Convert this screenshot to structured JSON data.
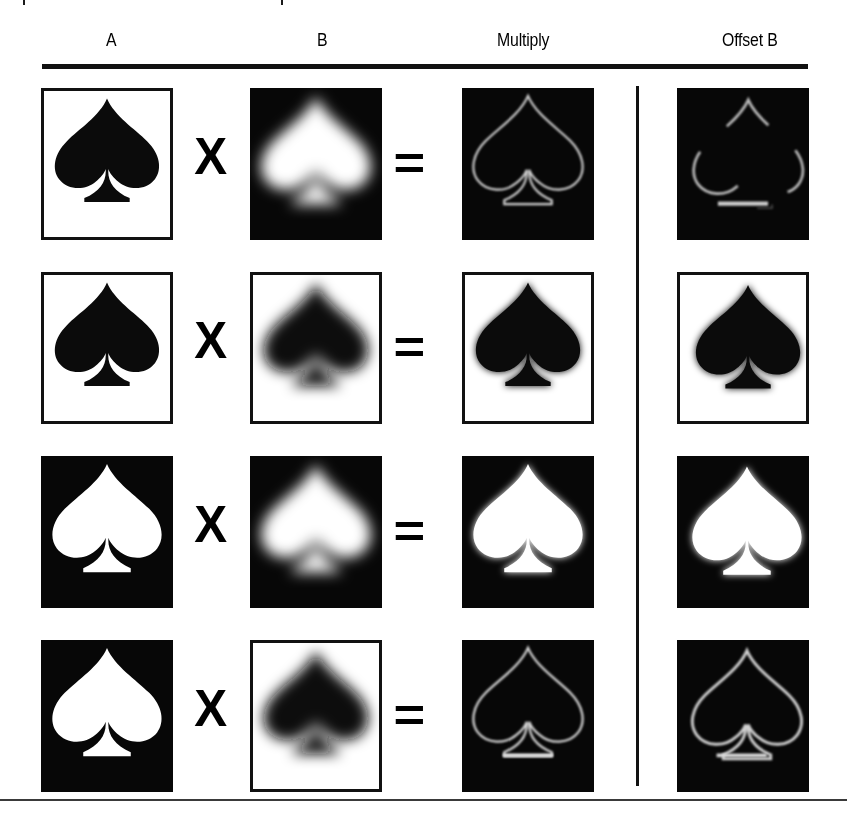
{
  "figure": {
    "background": "#ffffff",
    "width": 847,
    "height": 813,
    "accent_dark": "#070707",
    "accent_light": "#ffffff",
    "rule_color": "#111111"
  },
  "headers": [
    {
      "label": "A",
      "center_x": 106
    },
    {
      "label": "B",
      "center_x": 317
    },
    {
      "label": "Multiply",
      "center_x": 524
    },
    {
      "label": "Offset B",
      "center_x": 753
    }
  ],
  "operators": {
    "times": "X",
    "equals": "="
  },
  "columns": {
    "a_x": 41,
    "b_x": 250,
    "multiply_x": 462,
    "offset_x": 677,
    "times_x": 196,
    "equals_x": 396,
    "divider_x": 636
  },
  "rows": [
    {
      "name": "row-1",
      "top": 88,
      "panels": {
        "a": {
          "bg": "black-on-white",
          "border": true,
          "shape": "sharp",
          "fill": "#0b0b0b",
          "blur": 0
        },
        "b": {
          "bg": "white-on-black",
          "border": false,
          "shape": "blurred",
          "fill": "#ffffff",
          "blur": 9
        },
        "multiply": {
          "bg": "outline-on-black",
          "border": false,
          "shape": "outline",
          "fill": "#c9c9c9",
          "blur": 2
        },
        "offset": {
          "bg": "outline-on-black",
          "border": false,
          "shape": "offset-outline",
          "fill": "#c9c9c9",
          "blur": 2
        }
      }
    },
    {
      "name": "row-2",
      "top": 272,
      "panels": {
        "a": {
          "bg": "black-on-white",
          "border": true,
          "shape": "sharp",
          "fill": "#0b0b0b",
          "blur": 0
        },
        "b": {
          "bg": "black-on-white",
          "border": true,
          "shape": "blurred",
          "fill": "#0b0b0b",
          "blur": 9
        },
        "multiply": {
          "bg": "black-on-white",
          "border": true,
          "shape": "blurred",
          "fill": "#0b0b0b",
          "blur": 4
        },
        "offset": {
          "bg": "black-on-white",
          "border": true,
          "shape": "offset-blurred",
          "fill": "#0b0b0b",
          "blur": 5
        }
      }
    },
    {
      "name": "row-3",
      "top": 456,
      "panels": {
        "a": {
          "bg": "white-on-black",
          "border": false,
          "shape": "sharp",
          "fill": "#ffffff",
          "blur": 0
        },
        "b": {
          "bg": "white-on-black",
          "border": false,
          "shape": "blurred",
          "fill": "#ffffff",
          "blur": 9
        },
        "multiply": {
          "bg": "white-on-black",
          "border": false,
          "shape": "blurred",
          "fill": "#ffffff",
          "blur": 4
        },
        "offset": {
          "bg": "white-on-black",
          "border": false,
          "shape": "offset-blurred",
          "fill": "#ffffff",
          "blur": 4
        }
      }
    },
    {
      "name": "row-4",
      "top": 640,
      "panels": {
        "a": {
          "bg": "white-on-black",
          "border": false,
          "shape": "sharp",
          "fill": "#ffffff",
          "blur": 0
        },
        "b": {
          "bg": "black-on-white",
          "border": true,
          "shape": "blurred",
          "fill": "#0b0b0b",
          "blur": 9
        },
        "multiply": {
          "bg": "outline-on-black",
          "border": false,
          "shape": "outline",
          "fill": "#cfcfcf",
          "blur": 2
        },
        "offset": {
          "bg": "outline-on-black",
          "border": false,
          "shape": "offset-outline",
          "fill": "#cfcfcf",
          "blur": 2
        }
      }
    }
  ]
}
